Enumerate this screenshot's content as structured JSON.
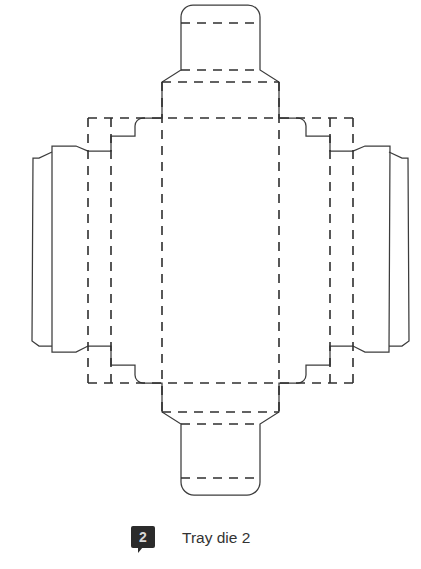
{
  "figure": {
    "title": "Tray die 2",
    "badge_number": "2",
    "badge_color": "#2b2b2b",
    "badge_text_color": "#d8d8d8",
    "caption_color": "#333333",
    "cut_line_color": "#3c3c3c",
    "fold_line_color": "#2f2f2f",
    "background_color": "#ffffff",
    "fold_dash_pattern": "9 7",
    "diagram_type": "packaging die-cut / dieline template",
    "canvas": {
      "width": 421,
      "height": 569
    }
  },
  "geometry": {
    "outline_path": "M 181 17 A 12 12 0 0 1 193 5 L 248 5 A 12 12 0 0 1 260 17 L 260 70 L 279 82 L 279 118 L 298 118 A 8 8 0 0 1 306 126 L 306 136 L 330 136 L 330 151 L 353 151 L 365 146 L 390 146 L 389 352 L 365 352 L 353 346 L 330 346 L 330 365 L 306 365 L 306 375 A 8 8 0 0 1 298 383 L 279 383 L 279 412 L 260 424 L 260 482 A 13 13 0 0 1 247 495 L 194 495 A 13 13 0 0 1 181 482 L 181 424 L 162 412 L 162 383 L 143 383 A 8 8 0 0 1 135 375 L 135 365 L 111 365 L 111 346 L 88 346 L 76 352 L 52 352 L 52 146 L 76 146 L 88 151 L 111 151 L 111 136 L 135 136 L 135 126 A 8 8 0 0 1 143 118 L 162 118 L 162 82 L 181 70 Z",
    "left_outer_flap_path": "M 52 152 L 39 158 L 33 158 L 32 341 L 39 346 L 52 346",
    "right_outer_flap_path": "M 389 152 L 402 158 L 408 158 L 409 341 L 402 346 L 389 346",
    "fold_lines": [
      {
        "name": "top-tab-upper-fold",
        "x1": 181,
        "y1": 23,
        "x2": 260,
        "y2": 23
      },
      {
        "name": "top-tab-lower-fold",
        "x1": 181,
        "y1": 70,
        "x2": 260,
        "y2": 70
      },
      {
        "name": "top-panel-fold",
        "x1": 162,
        "y1": 82,
        "x2": 279,
        "y2": 82
      },
      {
        "name": "top-main-fold",
        "x1": 88,
        "y1": 118,
        "x2": 353,
        "y2": 118
      },
      {
        "name": "bottom-main-fold",
        "x1": 88,
        "y1": 383,
        "x2": 353,
        "y2": 383
      },
      {
        "name": "bottom-panel-fold",
        "x1": 162,
        "y1": 412,
        "x2": 279,
        "y2": 412
      },
      {
        "name": "bottom-tab-upper-fold",
        "x1": 181,
        "y1": 424,
        "x2": 260,
        "y2": 424
      },
      {
        "name": "bottom-tab-lower-fold",
        "x1": 181,
        "y1": 478,
        "x2": 260,
        "y2": 478
      },
      {
        "name": "left-outer-vertical-fold",
        "x1": 88,
        "y1": 118,
        "x2": 88,
        "y2": 383
      },
      {
        "name": "left-inner-vertical-fold",
        "x1": 111,
        "y1": 118,
        "x2": 111,
        "y2": 383
      },
      {
        "name": "left-body-vertical-fold",
        "x1": 162,
        "y1": 82,
        "x2": 162,
        "y2": 412
      },
      {
        "name": "right-body-vertical-fold",
        "x1": 279,
        "y1": 82,
        "x2": 279,
        "y2": 412
      },
      {
        "name": "right-inner-vertical-fold",
        "x1": 330,
        "y1": 118,
        "x2": 330,
        "y2": 383
      },
      {
        "name": "right-outer-vertical-fold",
        "x1": 353,
        "y1": 118,
        "x2": 353,
        "y2": 383
      }
    ]
  }
}
